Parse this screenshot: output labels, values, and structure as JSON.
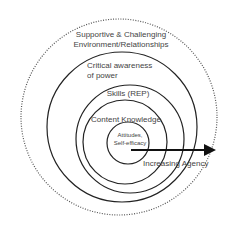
{
  "diagram": {
    "type": "nested-circles",
    "rings": [
      {
        "id": "outer",
        "label_line1": "Supportive & Challenging",
        "label_line2": "Environment/Relationships",
        "style": "dotted"
      },
      {
        "id": "ring2",
        "label_line1": "Critical awareness",
        "label_line2": "of power",
        "style": "solid"
      },
      {
        "id": "ring3",
        "label_line1": "Skills (REP)",
        "style": "solid"
      },
      {
        "id": "ring4",
        "label_line1": "Content Knowledge",
        "style": "solid"
      },
      {
        "id": "core",
        "label_line1": "Attitudes,",
        "label_line2": "Self-efficacy",
        "style": "solid"
      }
    ],
    "arrow": {
      "label": "Increasing Agency",
      "direction": "right"
    },
    "colors": {
      "stroke": "#222222",
      "text": "#444444",
      "dots": "#555555"
    }
  }
}
